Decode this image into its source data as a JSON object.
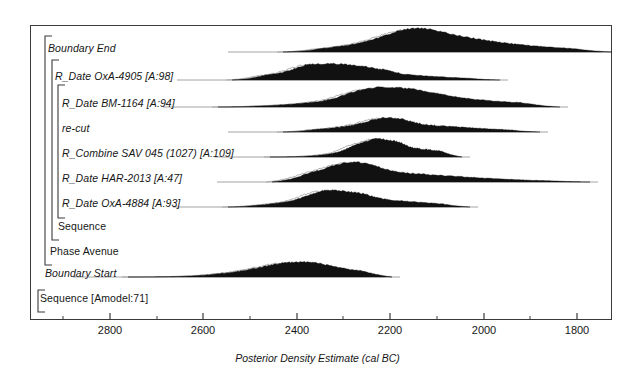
{
  "figure": {
    "kind": "oxcal-posterior-density-plot",
    "axis_title": "Posterior Density Estimate (cal BC)",
    "model_label": "Sequence [Amodel:71]",
    "axis_ticks": [
      {
        "label": "2800",
        "value": 2800,
        "x": 110
      },
      {
        "label": "2600",
        "value": 2600,
        "x": 203
      },
      {
        "label": "2400",
        "value": 2400,
        "x": 297
      },
      {
        "label": "2200",
        "value": 2200,
        "x": 390
      },
      {
        "label": "2000",
        "value": 2000,
        "x": 484
      },
      {
        "label": "1800",
        "value": 1800,
        "x": 577
      }
    ],
    "minor_ticks_x": [
      63,
      157,
      250,
      343,
      437,
      530
    ],
    "axis_range_cal_bc": [
      2900,
      1750
    ]
  },
  "rows": [
    {
      "id": "boundary-end",
      "label": "Boundary End",
      "style": "italic",
      "label_x": 48,
      "baseline_y": 52
    },
    {
      "id": "r-date-oxa-4905",
      "label": "R_Date OxA-4905 [A:98]",
      "style": "italic",
      "label_x": 55,
      "baseline_y": 80
    },
    {
      "id": "r-date-bm-1164",
      "label": "R_Date BM-1164 [A:94]",
      "style": "italic",
      "label_x": 62,
      "baseline_y": 107
    },
    {
      "id": "re-cut",
      "label": "re-cut",
      "style": "italic",
      "label_x": 62,
      "baseline_y": 132
    },
    {
      "id": "r-combine-sav-045",
      "label": "R_Combine SAV 045 (1027) [A:109]",
      "style": "italic",
      "label_x": 62,
      "baseline_y": 157
    },
    {
      "id": "r-date-har-2013",
      "label": "R_Date HAR-2013 [A:47]",
      "style": "italic",
      "label_x": 62,
      "baseline_y": 182
    },
    {
      "id": "r-date-oxa-4884",
      "label": "R_Date OxA-4884 [A:93]",
      "style": "italic",
      "label_x": 62,
      "baseline_y": 207
    },
    {
      "id": "sequence-inner",
      "label": "Sequence",
      "style": "upright",
      "label_x": 58,
      "baseline_y": 230
    },
    {
      "id": "phase-avenue",
      "label": "Phase Avenue",
      "style": "upright",
      "label_x": 50,
      "baseline_y": 255
    },
    {
      "id": "boundary-start",
      "label": "Boundary Start",
      "style": "italic",
      "label_x": 45,
      "baseline_y": 277
    },
    {
      "id": "sequence-amodel",
      "label": "Sequence [Amodel:71]",
      "style": "upright",
      "label_x": 40,
      "baseline_y": 302
    }
  ],
  "brackets": [
    {
      "id": "bracket-sequence-amodel",
      "x": 38,
      "top": 290,
      "bottom": 312
    },
    {
      "id": "bracket-phase-avenue",
      "x": 45,
      "top": 36,
      "bottom": 265
    },
    {
      "id": "bracket-sequence-inner",
      "x": 52,
      "top": 60,
      "bottom": 240
    },
    {
      "id": "bracket-inner-phase",
      "x": 58,
      "top": 85,
      "bottom": 218
    }
  ],
  "distributions": [
    {
      "row": "boundary-end",
      "baseline_y": 52,
      "filled": true,
      "range_start_x": 283,
      "range_end_x": 612,
      "peak_x": 412,
      "peak_height": 16,
      "hpd_ranges_cal_bc": [
        [
          2290,
          1770
        ]
      ]
    },
    {
      "row": "r-date-oxa-4905",
      "baseline_y": 80,
      "filled": true,
      "range_start_x": 232,
      "range_end_x": 500,
      "peak_x": 320,
      "peak_height": 12,
      "hpd_ranges_cal_bc": [
        [
          2400,
          2010
        ]
      ]
    },
    {
      "row": "r-date-bm-1164",
      "baseline_y": 107,
      "filled": true,
      "range_start_x": 218,
      "range_end_x": 560,
      "peak_x": 385,
      "peak_height": 13,
      "hpd_ranges_cal_bc": [
        [
          2290,
          2120
        ]
      ]
    },
    {
      "row": "re-cut",
      "baseline_y": 132,
      "filled": true,
      "range_start_x": 283,
      "range_end_x": 540,
      "peak_x": 383,
      "peak_height": 10,
      "hpd_ranges_cal_bc": [
        [
          2280,
          2150
        ]
      ]
    },
    {
      "row": "r-combine-sav-045",
      "baseline_y": 157,
      "filled": true,
      "range_start_x": 270,
      "range_end_x": 462,
      "peak_x": 380,
      "peak_height": 13,
      "hpd_ranges_cal_bc": [
        [
          2290,
          2180
        ]
      ]
    },
    {
      "row": "r-date-har-2013",
      "baseline_y": 182,
      "filled": true,
      "range_start_x": 272,
      "range_end_x": 590,
      "peak_x": 350,
      "peak_height": 13,
      "hpd_ranges_cal_bc": [
        [
          2330,
          2250
        ]
      ]
    },
    {
      "row": "r-date-oxa-4884",
      "baseline_y": 207,
      "filled": true,
      "range_start_x": 228,
      "range_end_x": 470,
      "peak_x": 333,
      "peak_height": 12,
      "hpd_ranges_cal_bc": [
        [
          2360,
          2200
        ]
      ]
    },
    {
      "row": "boundary-start",
      "baseline_y": 277,
      "filled": true,
      "range_start_x": 128,
      "range_end_x": 392,
      "peak_x": 285,
      "peak_height": 12,
      "hpd_ranges_cal_bc": [
        [
          2570,
          2280
        ]
      ]
    }
  ],
  "colors": {
    "fill": "#111111",
    "outline": "#9a9a9a",
    "frame": "#3a3a3a",
    "text": "#161616",
    "background": "#ffffff"
  }
}
